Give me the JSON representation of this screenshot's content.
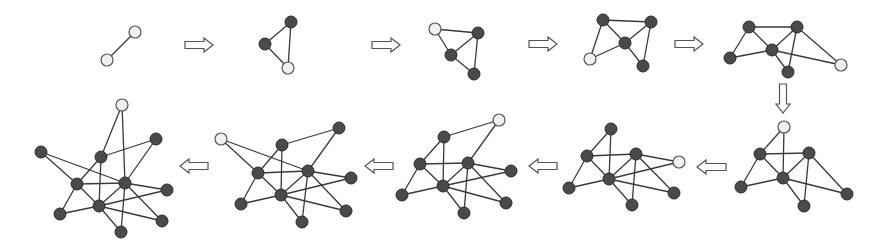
{
  "title": "Graph growth sequence: nodes added step by step",
  "colors": {
    "edge": "#3a3a3a",
    "node_dark": "#4a4a4a",
    "node_light": "#f0f0f0",
    "arrow_stroke": "#555555"
  },
  "node_radius": 6,
  "panels": [
    {
      "id": 1,
      "nodes": [
        [
          135,
          32,
          "light"
        ],
        [
          107,
          60,
          "light"
        ]
      ],
      "edges": [
        [
          0,
          1
        ]
      ]
    },
    {
      "id": 2,
      "nodes": [
        [
          291,
          22,
          "dark"
        ],
        [
          265,
          44,
          "dark"
        ],
        [
          288,
          68,
          "light"
        ]
      ],
      "edges": [
        [
          0,
          1
        ],
        [
          1,
          2
        ],
        [
          0,
          2
        ]
      ]
    },
    {
      "id": 3,
      "nodes": [
        [
          435,
          29,
          "light"
        ],
        [
          478,
          33,
          "dark"
        ],
        [
          451,
          55,
          "dark"
        ],
        [
          474,
          74,
          "dark"
        ]
      ],
      "edges": [
        [
          0,
          1
        ],
        [
          0,
          2
        ],
        [
          1,
          2
        ],
        [
          1,
          3
        ],
        [
          2,
          3
        ]
      ]
    },
    {
      "id": 4,
      "nodes": [
        [
          603,
          20,
          "dark"
        ],
        [
          651,
          22,
          "dark"
        ],
        [
          625,
          43,
          "dark"
        ],
        [
          590,
          59,
          "light"
        ],
        [
          643,
          66,
          "dark"
        ]
      ],
      "edges": [
        [
          0,
          1
        ],
        [
          0,
          2
        ],
        [
          0,
          3
        ],
        [
          1,
          2
        ],
        [
          1,
          4
        ],
        [
          2,
          3
        ],
        [
          2,
          4
        ]
      ]
    },
    {
      "id": 5,
      "nodes": [
        [
          749,
          27,
          "dark"
        ],
        [
          797,
          27,
          "dark"
        ],
        [
          772,
          50,
          "dark"
        ],
        [
          730,
          58,
          "dark"
        ],
        [
          788,
          72,
          "dark"
        ],
        [
          841,
          65,
          "light"
        ]
      ],
      "edges": [
        [
          0,
          1
        ],
        [
          0,
          2
        ],
        [
          0,
          3
        ],
        [
          1,
          2
        ],
        [
          1,
          4
        ],
        [
          1,
          5
        ],
        [
          2,
          3
        ],
        [
          2,
          4
        ],
        [
          2,
          5
        ]
      ]
    },
    {
      "id": 6,
      "nodes": [
        [
          784,
          127,
          "light"
        ],
        [
          760,
          154,
          "dark"
        ],
        [
          809,
          153,
          "dark"
        ],
        [
          783,
          178,
          "dark"
        ],
        [
          741,
          187,
          "dark"
        ],
        [
          847,
          194,
          "dark"
        ],
        [
          804,
          206,
          "dark"
        ]
      ],
      "edges": [
        [
          0,
          1
        ],
        [
          0,
          3
        ],
        [
          1,
          2
        ],
        [
          1,
          3
        ],
        [
          1,
          4
        ],
        [
          2,
          3
        ],
        [
          2,
          6
        ],
        [
          2,
          5
        ],
        [
          3,
          4
        ],
        [
          3,
          6
        ],
        [
          3,
          5
        ]
      ]
    },
    {
      "id": 7,
      "nodes": [
        [
          611,
          129,
          "dark"
        ],
        [
          587,
          156,
          "dark"
        ],
        [
          636,
          154,
          "dark"
        ],
        [
          679,
          162,
          "light"
        ],
        [
          609,
          179,
          "dark"
        ],
        [
          569,
          188,
          "dark"
        ],
        [
          674,
          193,
          "dark"
        ],
        [
          632,
          205,
          "dark"
        ]
      ],
      "edges": [
        [
          0,
          1
        ],
        [
          0,
          4
        ],
        [
          1,
          2
        ],
        [
          1,
          4
        ],
        [
          1,
          5
        ],
        [
          2,
          4
        ],
        [
          2,
          7
        ],
        [
          2,
          6
        ],
        [
          2,
          3
        ],
        [
          4,
          5
        ],
        [
          4,
          7
        ],
        [
          4,
          6
        ],
        [
          4,
          3
        ]
      ]
    },
    {
      "id": 8,
      "nodes": [
        [
          499,
          120,
          "light"
        ],
        [
          444,
          137,
          "dark"
        ],
        [
          420,
          164,
          "dark"
        ],
        [
          468,
          163,
          "dark"
        ],
        [
          511,
          171,
          "dark"
        ],
        [
          443,
          186,
          "dark"
        ],
        [
          402,
          195,
          "dark"
        ],
        [
          506,
          203,
          "dark"
        ],
        [
          464,
          213,
          "dark"
        ]
      ],
      "edges": [
        [
          0,
          1
        ],
        [
          0,
          3
        ],
        [
          1,
          2
        ],
        [
          1,
          5
        ],
        [
          2,
          3
        ],
        [
          2,
          5
        ],
        [
          2,
          6
        ],
        [
          3,
          5
        ],
        [
          3,
          8
        ],
        [
          3,
          7
        ],
        [
          3,
          4
        ],
        [
          5,
          6
        ],
        [
          5,
          8
        ],
        [
          5,
          7
        ],
        [
          5,
          4
        ]
      ]
    },
    {
      "id": 9,
      "nodes": [
        [
          221,
          139,
          "light"
        ],
        [
          339,
          128,
          "dark"
        ],
        [
          282,
          145,
          "dark"
        ],
        [
          258,
          173,
          "dark"
        ],
        [
          308,
          171,
          "dark"
        ],
        [
          351,
          178,
          "dark"
        ],
        [
          281,
          195,
          "dark"
        ],
        [
          241,
          204,
          "dark"
        ],
        [
          346,
          211,
          "dark"
        ],
        [
          302,
          222,
          "dark"
        ]
      ],
      "edges": [
        [
          0,
          3
        ],
        [
          0,
          4
        ],
        [
          1,
          2
        ],
        [
          1,
          4
        ],
        [
          2,
          3
        ],
        [
          2,
          6
        ],
        [
          3,
          4
        ],
        [
          3,
          6
        ],
        [
          3,
          7
        ],
        [
          4,
          6
        ],
        [
          4,
          9
        ],
        [
          4,
          8
        ],
        [
          4,
          5
        ],
        [
          6,
          7
        ],
        [
          6,
          9
        ],
        [
          6,
          8
        ],
        [
          6,
          5
        ]
      ]
    },
    {
      "id": 10,
      "nodes": [
        [
          122,
          105,
          "light"
        ],
        [
          156,
          139,
          "dark"
        ],
        [
          41,
          152,
          "dark"
        ],
        [
          101,
          157,
          "dark"
        ],
        [
          77,
          184,
          "dark"
        ],
        [
          125,
          183,
          "dark"
        ],
        [
          167,
          190,
          "dark"
        ],
        [
          99,
          206,
          "dark"
        ],
        [
          60,
          214,
          "dark"
        ],
        [
          162,
          221,
          "dark"
        ],
        [
          121,
          232,
          "dark"
        ]
      ],
      "edges": [
        [
          0,
          3
        ],
        [
          0,
          5
        ],
        [
          1,
          3
        ],
        [
          1,
          5
        ],
        [
          2,
          4
        ],
        [
          2,
          5
        ],
        [
          3,
          4
        ],
        [
          3,
          7
        ],
        [
          4,
          5
        ],
        [
          4,
          7
        ],
        [
          4,
          8
        ],
        [
          5,
          7
        ],
        [
          5,
          10
        ],
        [
          5,
          9
        ],
        [
          5,
          6
        ],
        [
          7,
          8
        ],
        [
          7,
          10
        ],
        [
          7,
          9
        ],
        [
          7,
          6
        ]
      ]
    }
  ],
  "arrows": [
    {
      "dir": "right",
      "x1": 185,
      "x2": 213,
      "y": 45
    },
    {
      "dir": "right",
      "x1": 372,
      "x2": 400,
      "y": 45
    },
    {
      "dir": "right",
      "x1": 529,
      "x2": 557,
      "y": 44
    },
    {
      "dir": "right",
      "x1": 675,
      "x2": 703,
      "y": 44
    },
    {
      "dir": "down",
      "x": 783,
      "y1": 84,
      "y2": 113
    },
    {
      "dir": "left",
      "x1": 697,
      "x2": 726,
      "y": 167
    },
    {
      "dir": "left",
      "x1": 529,
      "x2": 557,
      "y": 166
    },
    {
      "dir": "left",
      "x1": 365,
      "x2": 393,
      "y": 166
    },
    {
      "dir": "left",
      "x1": 180,
      "x2": 208,
      "y": 166
    }
  ]
}
